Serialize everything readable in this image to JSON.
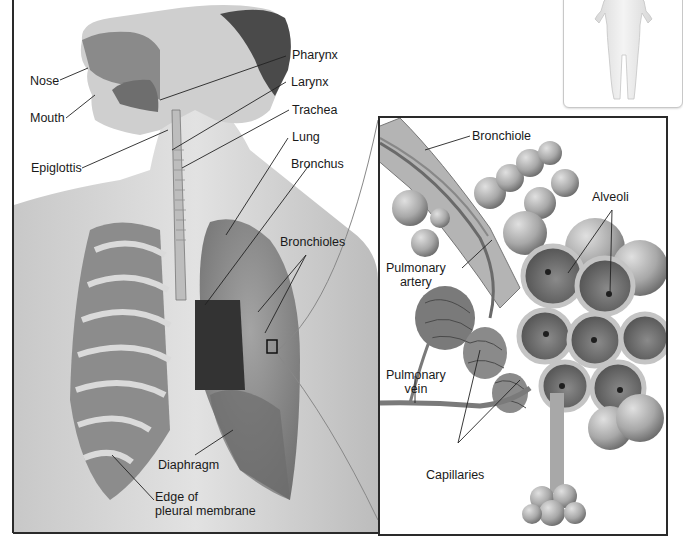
{
  "figure": {
    "main_panel": {
      "labels": {
        "nose": "Nose",
        "mouth": "Mouth",
        "epiglottis": "Epiglottis",
        "pharynx": "Pharynx",
        "larynx": "Larynx",
        "trachea": "Trachea",
        "lung": "Lung",
        "bronchus": "Bronchus",
        "bronchioles": "Bronchioles",
        "diaphragm": "Diaphragm",
        "pleural_line1": "Edge of",
        "pleural_line2": "pleural membrane"
      }
    },
    "inset_panel": {
      "labels": {
        "bronchiole": "Bronchiole",
        "alveoli": "Alveoli",
        "pulmonary_artery_line1": "Pulmonary",
        "pulmonary_artery_line2": "artery",
        "pulmonary_vein_line1": "Pulmonary",
        "pulmonary_vein_line2": "vein",
        "capillaries": "Capillaries"
      }
    },
    "orientation_thumbnail": {
      "description": "full body silhouette"
    },
    "colors": {
      "frame": "#2a2a2a",
      "tissue_light": "#d4d4d4",
      "tissue_mid": "#9a9a9a",
      "tissue_dark": "#5a5a5a",
      "leader_line": "#222222"
    }
  }
}
